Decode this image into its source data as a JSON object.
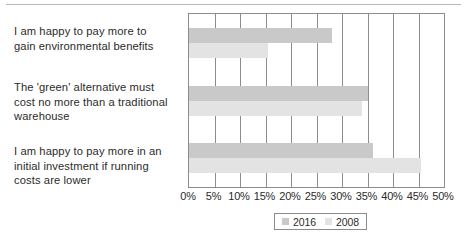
{
  "chart_data": {
    "type": "bar",
    "orientation": "horizontal",
    "title": "",
    "xlabel": "",
    "ylabel": "",
    "xlim": [
      0,
      50
    ],
    "xtick_labels": [
      "0%",
      "5%",
      "10%",
      "15%",
      "20%",
      "25%",
      "30%",
      "35%",
      "40%",
      "45%",
      "50%"
    ],
    "xtick_values": [
      0,
      5,
      10,
      15,
      20,
      25,
      30,
      35,
      40,
      45,
      50
    ],
    "grid": true,
    "grid_axis": "x",
    "legend_position": "bottom",
    "categories": [
      "I am happy to pay more to gain environmental benefits",
      "The 'green' alternative must cost no more than a traditional warehouse",
      "I am happy to pay more in an initial investment if running costs are lower"
    ],
    "series": [
      {
        "name": "2016",
        "color": "#c9c9c9",
        "values": [
          28,
          35,
          36
        ]
      },
      {
        "name": "2008",
        "color": "#e3e3e3",
        "values": [
          15.5,
          34,
          45.5
        ]
      }
    ]
  },
  "category_lines": [
    [
      "I am happy to pay more to",
      "gain environmental benefits"
    ],
    [
      "The 'green' alternative must",
      "cost no more than a traditional",
      "warehouse"
    ],
    [
      "I am happy to pay more in an",
      "initial investment if running",
      "costs are lower"
    ]
  ],
  "legend": {
    "items": [
      {
        "label": "2016",
        "color": "#c9c9c9"
      },
      {
        "label": "2008",
        "color": "#e3e3e3"
      }
    ]
  },
  "colors": {
    "series_2016": "#c9c9c9",
    "series_2008": "#e3e3e3",
    "axis": "#8c8c8c",
    "text": "#2b2b2b",
    "background": "#ffffff"
  }
}
